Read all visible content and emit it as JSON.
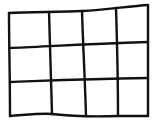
{
  "diagram": {
    "type": "hand-drawn grid",
    "columns": 4,
    "rows": 3,
    "line_color": "#111111",
    "background_color": "#ffffff"
  }
}
